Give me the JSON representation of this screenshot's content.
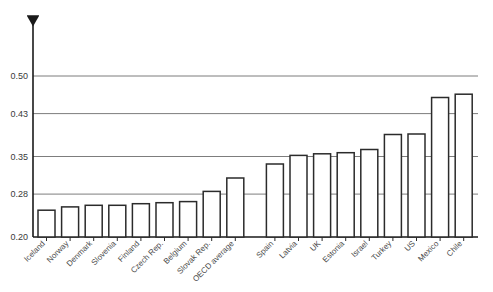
{
  "chart_data": {
    "type": "bar",
    "title": "",
    "subtitle": "",
    "xlabel": "",
    "ylabel": "",
    "ylim": [
      0.2,
      0.5
    ],
    "yticks": [
      "0.20",
      "0.28",
      "0.35",
      "0.43",
      "0.50"
    ],
    "ytick_values": [
      0.2,
      0.28,
      0.35,
      0.43,
      0.5
    ],
    "grid": "horizontal",
    "legend": "none",
    "categories": [
      "Iceland",
      "Norway",
      "Denmark",
      "Slovenia",
      "Finland",
      "Czech Rep.",
      "Belgium",
      "Slovak Rep.",
      "OECD average",
      "Spain",
      "Latvia",
      "UK",
      "Estonia",
      "Israel",
      "Turkey",
      "US",
      "Mexico",
      "Chile"
    ],
    "values": [
      0.25,
      0.256,
      0.259,
      0.259,
      0.262,
      0.264,
      0.266,
      0.285,
      0.31,
      0.336,
      0.352,
      0.355,
      0.357,
      0.363,
      0.391,
      0.392,
      0.46,
      0.466
    ],
    "bar_style": {
      "fill": "#ffffff",
      "stroke": "#2b2b2b"
    },
    "axis_arrow": "up-arrow-y-axis",
    "label_rotation": -45
  }
}
